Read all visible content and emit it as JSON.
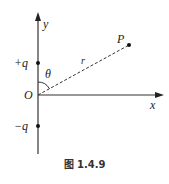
{
  "diagram": {
    "axes": {
      "x_label": "x",
      "y_label": "y",
      "origin_label": "O"
    },
    "charges": [
      {
        "label": "+q",
        "position": "positive y-axis"
      },
      {
        "label": "−q",
        "position": "negative y-axis"
      }
    ],
    "point": {
      "label": "P"
    },
    "distance_label": "r",
    "angle_label": "θ",
    "caption": "图 1.4.9",
    "colors": {
      "stroke": "#333333",
      "background": "#ffffff"
    }
  }
}
